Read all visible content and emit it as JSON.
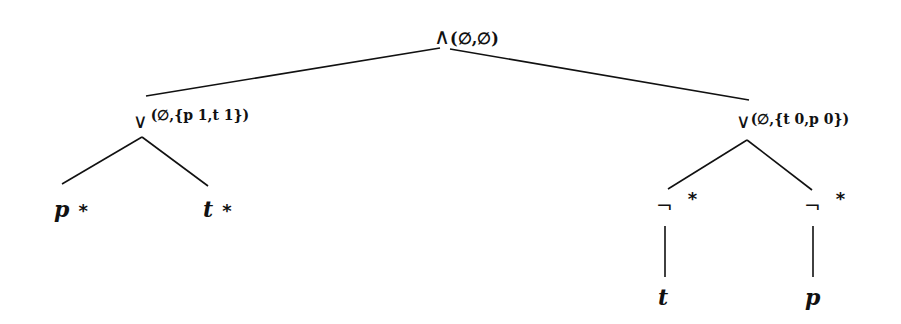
{
  "diagram": {
    "type": "tree",
    "root": {
      "operator": "∧",
      "annotation": "(∅,∅)",
      "children": [
        "left_or",
        "right_or"
      ]
    },
    "left_or": {
      "operator": "∨",
      "annotation": "(∅,{p 1,t 1})",
      "children": [
        "leaf_p",
        "leaf_t"
      ]
    },
    "right_or": {
      "operator": "∨",
      "annotation": "(∅,{t 0,p 0})",
      "children": [
        "neg_t",
        "neg_p"
      ]
    },
    "leaf_p": {
      "var": "p",
      "mark": "*"
    },
    "leaf_t": {
      "var": "t",
      "mark": "*"
    },
    "neg_t": {
      "operator": "¬",
      "mark": "*",
      "child": "t"
    },
    "neg_p": {
      "operator": "¬",
      "mark": "*",
      "child": "p"
    },
    "neg_t_child": {
      "var": "t"
    },
    "neg_p_child": {
      "var": "p"
    }
  }
}
